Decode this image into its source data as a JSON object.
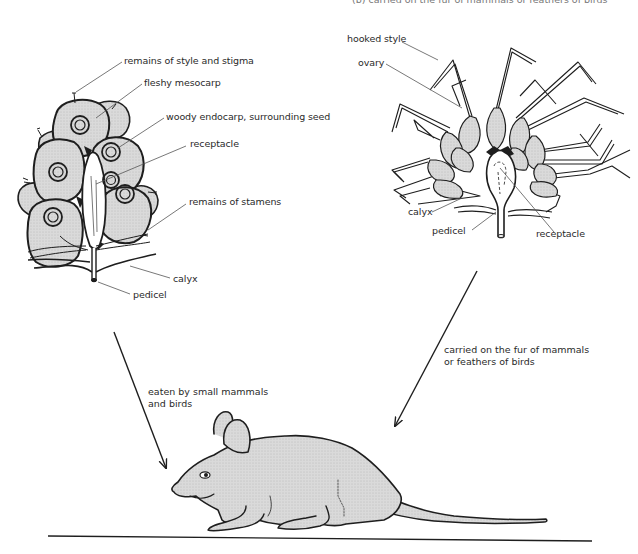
{
  "figure": {
    "top_cut_text": "(b) carried on the fur of mammals or feathers of birds",
    "colors": {
      "fill": "#d9d9d9",
      "stroke": "#1e1e1e",
      "leader": "#555555",
      "text": "#2a2a2a"
    }
  },
  "fleshy_fruit": {
    "labels": [
      {
        "id": "style-stigma",
        "text": "remains of style and stigma"
      },
      {
        "id": "mesocarp",
        "text": "fleshy mesocarp"
      },
      {
        "id": "endocarp",
        "text": "woody endocarp, surrounding seed"
      },
      {
        "id": "receptacle",
        "text": "receptacle"
      },
      {
        "id": "stamens",
        "text": "remains of stamens"
      },
      {
        "id": "calyx",
        "text": "calyx"
      },
      {
        "id": "pedicel",
        "text": "pedicel"
      }
    ]
  },
  "hooked_fruit": {
    "labels": [
      {
        "id": "hooked-style",
        "text": "hooked style"
      },
      {
        "id": "ovary",
        "text": "ovary"
      },
      {
        "id": "calyx",
        "text": "calyx"
      },
      {
        "id": "pedicel",
        "text": "pedicel"
      },
      {
        "id": "receptacle",
        "text": "receptacle"
      }
    ]
  },
  "arrows": {
    "left": {
      "line1": "eaten by small mammals",
      "line2": "and birds"
    },
    "right": {
      "line1": "carried on the fur of mammals",
      "line2": "or feathers of birds"
    }
  },
  "animal": {
    "name": "mouse"
  }
}
